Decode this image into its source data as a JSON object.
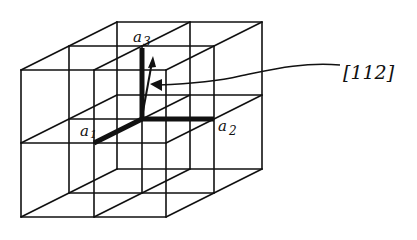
{
  "diagram": {
    "type": "cubic lattice with direction vector",
    "grid": "2x2x2 unit cells",
    "labels": {
      "a1": "a",
      "a1_sub": "1",
      "a2": "a",
      "a2_sub": "2",
      "a3": "a",
      "a3_sub": "3",
      "direction": "[112]"
    },
    "vectors": [
      {
        "name": "a1",
        "description": "basis vector along depth (toward viewer)"
      },
      {
        "name": "a2",
        "description": "basis vector to the right"
      },
      {
        "name": "a3",
        "description": "basis vector upward"
      },
      {
        "name": "[112]",
        "description": "direction arrow from origin"
      }
    ],
    "colors": {
      "line": "#111111",
      "background": "#ffffff"
    }
  }
}
